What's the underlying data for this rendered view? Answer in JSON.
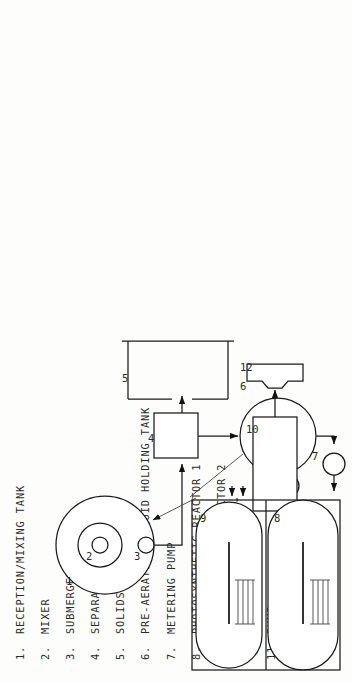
{
  "figure": {
    "orientation": "rotated-90-ccw",
    "line_color": "#1a1a1a",
    "background_color": "#fdfdfb"
  },
  "legend": {
    "items": [
      {
        "num": "1.",
        "label": "RECEPTION/MIXING TANK"
      },
      {
        "num": "2.",
        "label": "MIXER"
      },
      {
        "num": "3.",
        "label": "SUBMERGED PUMP"
      },
      {
        "num": "4.",
        "label": "SEPARATOR"
      },
      {
        "num": "5.",
        "label": "SOLIDS HOPPER"
      },
      {
        "num": "6.",
        "label": "PRE-AERATION/LIQUID HOLDING TANK"
      },
      {
        "num": "7.",
        "label": "METERING PUMP"
      },
      {
        "num": "8.",
        "label": "PHOTOSYNTHETIC REACTOR 1"
      },
      {
        "num": "9.",
        "label": "PHOTOSYNTHETIC REACTOR 2"
      },
      {
        "num": "10.",
        "label": "HOLDING TANK"
      },
      {
        "num": "11.",
        "label": "PUMP"
      },
      {
        "num": "12.",
        "label": "CENTRIFUGE"
      }
    ]
  },
  "refs": {
    "reception_mixing_tank": "1",
    "mixer": "2",
    "submerged_pump": "3",
    "separator": "4",
    "solids_hopper": "5",
    "pre_aeration_tank": "6",
    "metering_pump": "7",
    "reactor_1": "8",
    "reactor_2": "9",
    "holding_tank": "10",
    "pump": "11",
    "centrifuge": "12"
  }
}
